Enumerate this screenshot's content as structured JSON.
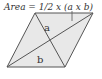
{
  "figure": {
    "formula": "Area = 1/2 x (a x b)",
    "diagonal_labels": {
      "a": "a",
      "b": "b"
    },
    "shape": "rhombus",
    "colors": {
      "fill": "#e8e8e8",
      "stroke": "#555555"
    }
  }
}
